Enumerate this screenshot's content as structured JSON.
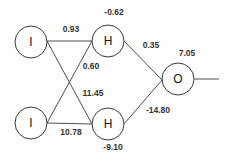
{
  "diagram": {
    "type": "neural-network",
    "nodes": [
      {
        "id": "i1",
        "label": "I",
        "layer": "input"
      },
      {
        "id": "i2",
        "label": "I",
        "layer": "input"
      },
      {
        "id": "h1",
        "label": "H",
        "layer": "hidden",
        "bias": "-0.62"
      },
      {
        "id": "h2",
        "label": "H",
        "layer": "hidden",
        "bias": "-9.10"
      },
      {
        "id": "o1",
        "label": "O",
        "layer": "output",
        "bias": "7.05"
      }
    ],
    "edges": [
      {
        "from": "i1",
        "to": "h1",
        "weight": "0.93"
      },
      {
        "from": "i2",
        "to": "h1",
        "weight": "0.60"
      },
      {
        "from": "i1",
        "to": "h2",
        "weight": "11.45"
      },
      {
        "from": "i2",
        "to": "h2",
        "weight": "10.78"
      },
      {
        "from": "h1",
        "to": "o1",
        "weight": "0.35"
      },
      {
        "from": "h2",
        "to": "o1",
        "weight": "-14.80"
      }
    ]
  }
}
